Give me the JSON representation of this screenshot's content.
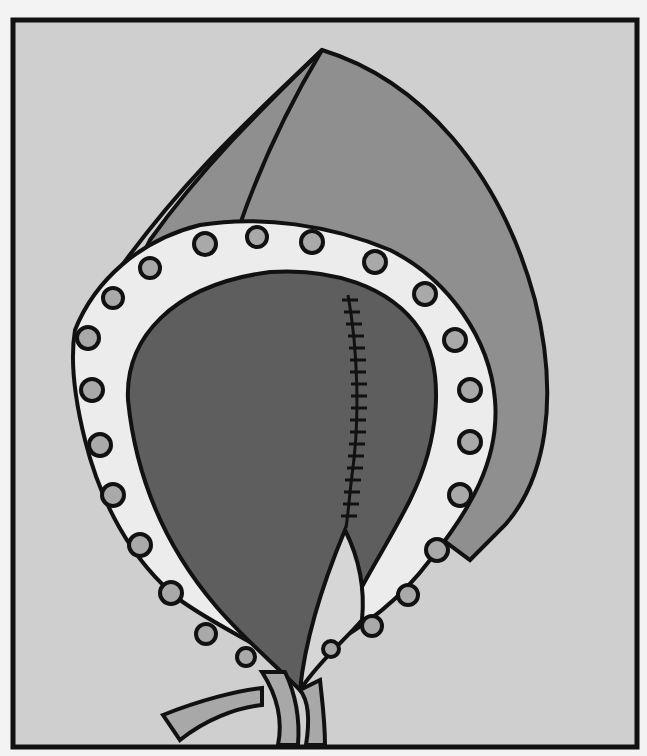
{
  "illustration": {
    "subject": "bonnet with eyelet lace trim and ties",
    "colors": {
      "page": "#f3f3f3",
      "panel": "#cfcfcf",
      "bonnet_outer": "#8f8f8f",
      "bonnet_inner": "#5e5e5e",
      "lace": "#ececec",
      "eyelet": "#a9a9a9",
      "ribbon": "#a8a8a8",
      "outline": "#111111"
    }
  }
}
